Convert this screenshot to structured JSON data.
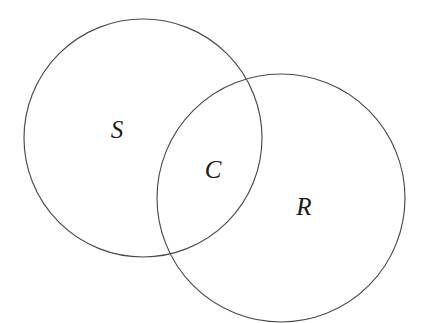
{
  "diagram": {
    "type": "venn-two-set",
    "background_color": "#ffffff",
    "stroke_color": "#4a4a4a",
    "text_color": "#1a1a1a",
    "width": 423,
    "height": 323,
    "circles": [
      {
        "id": "left",
        "set_label": "S",
        "cx": 143,
        "cy": 138,
        "r": 119
      },
      {
        "id": "right",
        "set_label": "R",
        "cx": 281,
        "cy": 198,
        "r": 124
      }
    ],
    "labels": [
      {
        "id": "s",
        "text": "S",
        "x": 117,
        "y": 129,
        "region": "left-only"
      },
      {
        "id": "c",
        "text": "C",
        "x": 213,
        "y": 169,
        "region": "intersection"
      },
      {
        "id": "r",
        "text": "R",
        "x": 304,
        "y": 206,
        "region": "right-only"
      }
    ],
    "intersection_points": [
      {
        "x": 255,
        "y": 98
      },
      {
        "x": 172,
        "y": 253
      }
    ]
  }
}
